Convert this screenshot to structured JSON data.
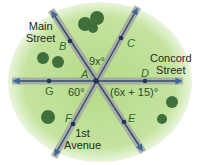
{
  "diagram": {
    "streets": {
      "main": [
        "Main",
        "Street"
      ],
      "concord": [
        "Concord",
        "Street"
      ],
      "first": [
        "1st",
        "Avenue"
      ]
    },
    "points": {
      "A": "A",
      "B": "B",
      "C": "C",
      "D": "D",
      "E": "E",
      "F": "F",
      "G": "G"
    },
    "angles": {
      "top": "9x°",
      "bottom_left": "60°",
      "bottom_right": "(6x + 15)°"
    },
    "colors": {
      "grass": "#b9dc8e",
      "road": "#a9aaa8",
      "line": "#2f4b6e",
      "tree": "#3f6f3a",
      "label_point": "#2d6b34"
    }
  }
}
